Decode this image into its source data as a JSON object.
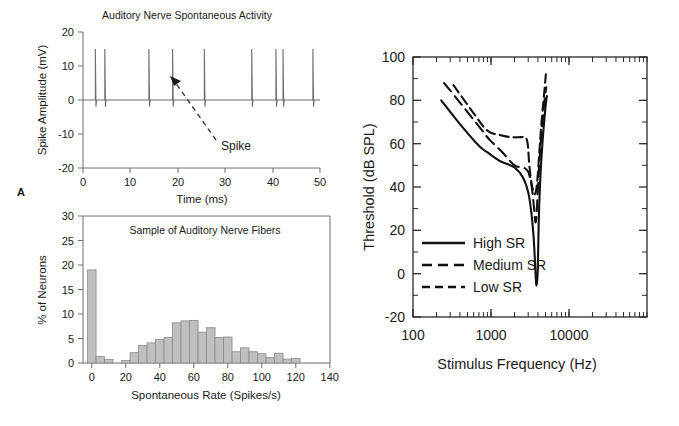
{
  "figure": {
    "panels": [
      {
        "letter": "A",
        "name": "spike-train-trace"
      },
      {
        "letter": "B",
        "name": "spontaneous-rate-histogram"
      },
      {
        "letter": "C",
        "name": "tuning-curves"
      }
    ]
  },
  "panel_a": {
    "letter": "A",
    "chart_data": {
      "type": "line",
      "title": "Auditory Nerve Spontaneous Activity",
      "xlabel": "Time (ms)",
      "ylabel": "Spike Amplitude (mV)",
      "xlim": [
        0,
        50
      ],
      "ylim": [
        -20,
        20
      ],
      "xticks": [
        0,
        10,
        20,
        30,
        40,
        50
      ],
      "yticks": [
        -20,
        -10,
        0,
        10,
        20
      ],
      "grid": false,
      "series": [
        {
          "name": "spike train",
          "description": "Extracellular spike events; each event rises to +15 mV then undershoots to -2 mV",
          "spike_times_ms": [
            2.6,
            4.6,
            13.9,
            18.9,
            25.6,
            35.6,
            40.7,
            42.2,
            48.5
          ],
          "spike_peak_mv": 15,
          "spike_undershoot_mv": -2,
          "baseline_mv": 0
        }
      ],
      "annotations": [
        {
          "name": "spike-callout",
          "text": "Spike",
          "points_to_x": 18.9,
          "points_to_y": 7
        }
      ]
    }
  },
  "panel_b": {
    "letter": "B",
    "chart_data": {
      "type": "bar",
      "title": "Sample of Auditory Nerve Fibers",
      "xlabel": "Spontaneous Rate (Spikes/s)",
      "ylabel": "% of Neurons",
      "xlim": [
        -5,
        140
      ],
      "ylim": [
        0,
        30
      ],
      "xticks": [
        0,
        20,
        40,
        60,
        80,
        100,
        120,
        140
      ],
      "yticks": [
        0,
        5,
        10,
        15,
        20,
        25,
        30
      ],
      "grid": false,
      "bin_width": 5,
      "bin_centers": [
        0,
        5,
        10,
        20,
        25,
        30,
        35,
        40,
        45,
        50,
        55,
        60,
        65,
        70,
        75,
        80,
        85,
        90,
        95,
        100,
        105,
        110,
        115,
        120
      ],
      "values": [
        19.0,
        1.3,
        0.7,
        0.5,
        2.1,
        3.6,
        4.1,
        4.8,
        5.2,
        8.2,
        8.6,
        8.7,
        6.3,
        7.2,
        5.2,
        5.3,
        2.3,
        3.1,
        2.3,
        1.9,
        1.1,
        2.0,
        0.8,
        0.9
      ]
    }
  },
  "panel_c": {
    "letter": "c",
    "chart_data": {
      "type": "line",
      "title": "",
      "xlabel": "Stimulus Frequency (Hz)",
      "ylabel": "Threshold (dB SPL)",
      "xscale": "log",
      "xlim": [
        100,
        20000
      ],
      "ylim": [
        -20,
        100
      ],
      "xticks": [
        100,
        1000,
        10000
      ],
      "xtick_labels": [
        "100",
        "1000",
        "10000"
      ],
      "yticks": [
        -20,
        0,
        20,
        40,
        60,
        80,
        100
      ],
      "grid": false,
      "legend_position": "lower-left",
      "series": [
        {
          "name": "High SR",
          "style": "solid",
          "points": [
            [
              230,
              80
            ],
            [
              400,
              69
            ],
            [
              700,
              59
            ],
            [
              900,
              56
            ],
            [
              1300,
              52
            ],
            [
              2000,
              49
            ],
            [
              2600,
              44
            ],
            [
              3100,
              35
            ],
            [
              3500,
              18
            ],
            [
              3750,
              -2
            ],
            [
              3850,
              -5
            ],
            [
              3980,
              2
            ],
            [
              4100,
              25
            ],
            [
              4300,
              45
            ],
            [
              4600,
              62
            ],
            [
              5000,
              77
            ],
            [
              5200,
              82
            ]
          ]
        },
        {
          "name": "Medium SR",
          "style": "dashed",
          "points": [
            [
              250,
              88
            ],
            [
              420,
              78
            ],
            [
              700,
              68
            ],
            [
              950,
              62
            ],
            [
              1400,
              56
            ],
            [
              2000,
              50
            ],
            [
              2600,
              49
            ],
            [
              3000,
              47
            ],
            [
              3300,
              41
            ],
            [
              3550,
              31
            ],
            [
              3700,
              24
            ],
            [
              3820,
              26
            ],
            [
              3950,
              36
            ],
            [
              4150,
              50
            ],
            [
              4400,
              63
            ],
            [
              4800,
              78
            ],
            [
              5100,
              86
            ]
          ]
        },
        {
          "name": "Low SR",
          "style": "dashed",
          "points": [
            [
              330,
              87
            ],
            [
              600,
              74
            ],
            [
              900,
              66
            ],
            [
              1300,
              64
            ],
            [
              1800,
              63
            ],
            [
              2400,
              63
            ],
            [
              2750,
              63
            ],
            [
              2950,
              60
            ],
            [
              3100,
              50
            ],
            [
              3300,
              42
            ],
            [
              3500,
              38
            ],
            [
              3700,
              37
            ],
            [
              3900,
              42
            ],
            [
              4150,
              55
            ],
            [
              4400,
              68
            ],
            [
              4800,
              83
            ],
            [
              5050,
              92
            ]
          ]
        }
      ],
      "legend": [
        {
          "label": "High SR",
          "style": "solid"
        },
        {
          "label": "Medium SR",
          "style": "dashed"
        },
        {
          "label": "Low SR",
          "style": "dashed"
        }
      ]
    }
  }
}
